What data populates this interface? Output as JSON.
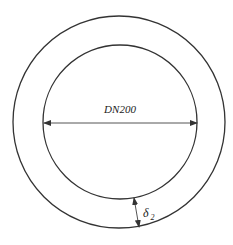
{
  "diagram": {
    "type": "pipe cross-section",
    "stroke_color": "#333333",
    "background": "#ffffff",
    "outer_circle": {
      "cx": 119,
      "cy": 122,
      "r": 106
    },
    "inner_circle": {
      "cx": 120,
      "cy": 122,
      "r": 77
    },
    "diameter_dimension": {
      "label": "DN200",
      "x1": 44,
      "x2": 197,
      "y": 123,
      "label_x": 120,
      "label_y": 113
    },
    "thickness_dimension": {
      "symbol": "δ",
      "subscript": "2",
      "x1": 134,
      "y1": 198,
      "x2": 139,
      "y2": 227,
      "label_x": 143,
      "label_y": 217
    }
  }
}
